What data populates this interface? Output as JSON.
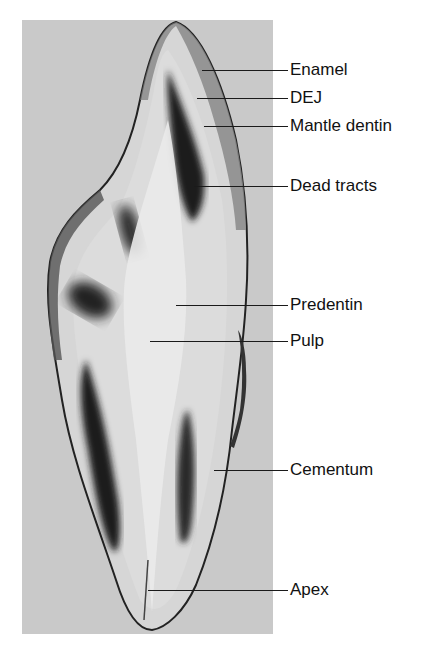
{
  "figure": {
    "type": "histological longitudinal section of a tooth",
    "panel_background": "#c9c9c9",
    "labels": [
      {
        "id": "enamel",
        "text": "Enamel",
        "y": 70,
        "line_from_x": 202
      },
      {
        "id": "dej",
        "text": "DEJ",
        "y": 98,
        "line_from_x": 197
      },
      {
        "id": "mantle-dentin",
        "text": "Mantle dentin",
        "y": 126,
        "line_from_x": 204
      },
      {
        "id": "dead-tracts",
        "text": "Dead tracts",
        "y": 186,
        "line_from_x": 194
      },
      {
        "id": "predentin",
        "text": "Predentin",
        "y": 305,
        "line_from_x": 176
      },
      {
        "id": "pulp",
        "text": "Pulp",
        "y": 341,
        "line_from_x": 150
      },
      {
        "id": "cementum",
        "text": "Cementum",
        "y": 470,
        "line_from_x": 214
      },
      {
        "id": "apex",
        "text": "Apex",
        "y": 590,
        "line_from_x": 148
      }
    ]
  }
}
